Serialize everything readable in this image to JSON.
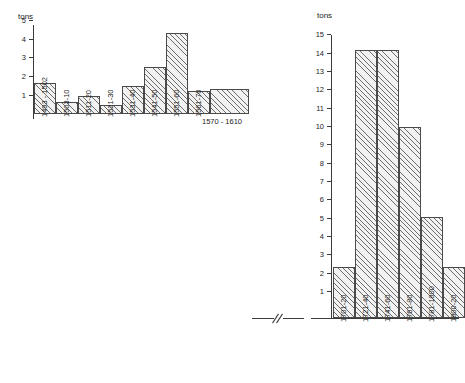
{
  "chart_data": [
    {
      "id": "left",
      "type": "bar",
      "title": "",
      "xlabel": "",
      "ylabel": "tons",
      "ylim": [
        0,
        5.3
      ],
      "yticks": [
        1,
        2,
        3,
        4,
        5
      ],
      "ytick_labels": [
        "1",
        "2",
        "3",
        "4",
        "5"
      ],
      "grid": false,
      "legend": "none",
      "categories": [
        "1493 - 1502",
        "1503-10",
        "1511-20",
        "1521-30",
        "1531-40",
        "1541-50",
        "1551-60",
        "1561-70",
        "1570 - 1610"
      ],
      "values": [
        1.6,
        0.6,
        0.9,
        0.45,
        1.45,
        2.5,
        4.3,
        1.2,
        1.3
      ],
      "bar_widths": [
        1,
        1,
        1,
        1,
        1,
        1,
        1,
        1,
        4
      ],
      "wide_bar_label": "1570 - 1610",
      "wide_bar_index": 8
    },
    {
      "id": "right",
      "type": "bar",
      "title": "",
      "xlabel": "",
      "ylabel": "tons",
      "ylim": [
        0,
        15.4
      ],
      "yticks": [
        1,
        2,
        3,
        4,
        5,
        6,
        7,
        8,
        9,
        10,
        11,
        12,
        13,
        14,
        15
      ],
      "ytick_labels": [
        "1",
        "2",
        "3",
        "4",
        "5",
        "6",
        "7",
        "8",
        "9",
        "10",
        "11",
        "12",
        "13",
        "14",
        "15"
      ],
      "grid": false,
      "legend": "none",
      "categories": [
        "1701-20",
        "1721-40",
        "1741-60",
        "1761-80",
        "1781-1800",
        "1800-20"
      ],
      "values": [
        2.8,
        14.65,
        14.65,
        10.45,
        5.5,
        2.8
      ],
      "bar_widths": [
        1,
        1,
        1,
        1,
        1,
        1
      ]
    }
  ],
  "left_axis": {
    "unit": "tons",
    "t1": "1",
    "t2": "2",
    "t3": "3",
    "t4": "4",
    "t5": "5"
  },
  "right_axis": {
    "unit": "tons",
    "t1": "1",
    "t2": "2",
    "t3": "3",
    "t4": "4",
    "t5": "5",
    "t6": "6",
    "t7": "7",
    "t8": "8",
    "t9": "9",
    "t10": "10",
    "t11": "11",
    "t12": "12",
    "t13": "13",
    "t14": "14",
    "t15": "15"
  },
  "left_categories": {
    "c0": "1493 - 1502",
    "c1": "1503-10",
    "c2": "1511-20",
    "c3": "1521-30",
    "c4": "1531-40",
    "c5": "1541-50",
    "c6": "1551-60",
    "c7": "1561-70",
    "c8": "1570 - 1610"
  },
  "right_categories": {
    "c0": "1701-20",
    "c1": "1721-40",
    "c2": "1741-60",
    "c3": "1761-80",
    "c4": "1781-1800",
    "c5": "1800-20"
  },
  "colors": {
    "ink": "#3b3b3b",
    "bar_fill": "#f2f2f2",
    "bar_hatch": "#6d6d6d",
    "background": "#ffffff"
  }
}
